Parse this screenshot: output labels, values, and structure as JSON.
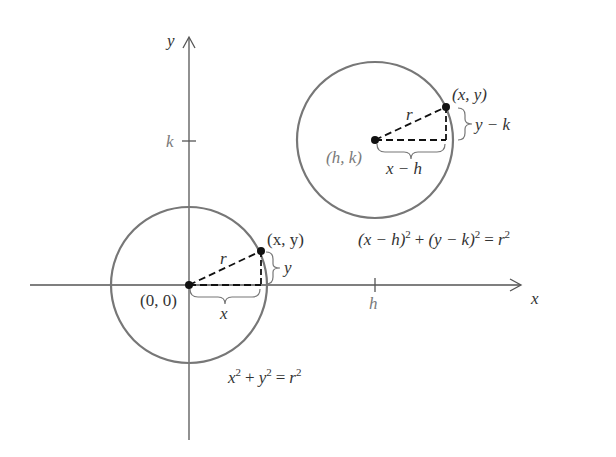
{
  "axes": {
    "x_label": "x",
    "y_label": "y",
    "x_tick_label": "h",
    "y_tick_label": "k"
  },
  "origin_circle": {
    "center_label": "(0, 0)",
    "point_label": "(x, y)",
    "radius_label": "r",
    "horizontal_leg_label": "x",
    "vertical_leg_label": "y",
    "equation": {
      "lhs1": "x",
      "sup1": "2",
      "plus": "+",
      "lhs2": "y",
      "sup2": "2",
      "eq": "=",
      "rhs": "r",
      "sup3": "2"
    }
  },
  "shifted_circle": {
    "center_label": "(h, k)",
    "point_label": "(x, y)",
    "radius_label": "r",
    "horizontal_leg_label": "x − h",
    "vertical_leg_label": "y − k",
    "equation": {
      "part1": "(x − h)",
      "sup1": "2",
      "plus": "+",
      "part2": "(y − k)",
      "sup2": "2",
      "eq": "=",
      "rhs": "r",
      "sup3": "2"
    }
  },
  "colors": {
    "axis": "#555555",
    "circle": "#777777",
    "dashed": "#111111",
    "text": "#333333",
    "tick_label": "#7a7a7a"
  }
}
